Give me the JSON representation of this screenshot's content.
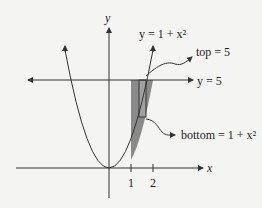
{
  "diagram": {
    "axis_x_label": "x",
    "axis_y_label": "y",
    "curve_label": "y = 1 + x²",
    "line_label": "y = 5",
    "top_label": "top = 5",
    "bottom_label": "bottom = 1 + x²",
    "ticks": [
      "1",
      "2"
    ],
    "colors": {
      "shade": "#8a8a8a",
      "stroke": "#333333",
      "background": "#f4f4f2"
    }
  }
}
